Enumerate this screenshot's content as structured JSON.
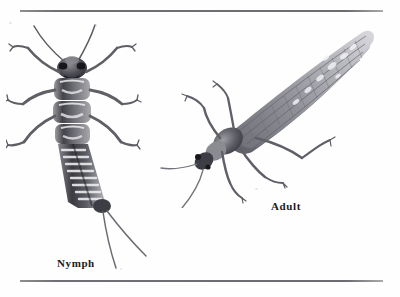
{
  "figure": {
    "type": "scientific-illustration-plate",
    "background_color": "#fefefe",
    "ink_color": "#3b3b3e",
    "rule_color": "#6d6d71",
    "label_color": "#1a1a1a",
    "rules": [
      {
        "name": "top-rule",
        "y": 10,
        "x1": 20,
        "x2": 383
      },
      {
        "name": "bottom-rule",
        "y": 280,
        "x1": 20,
        "x2": 383
      }
    ],
    "captions": {
      "nymph": "Nymph",
      "adult": "Adult"
    },
    "specimens": [
      {
        "name": "nymph",
        "label": "Nymph",
        "orientation": "dorsal view, head up, tilted slightly",
        "features": [
          "two long antennae",
          "compound eyes",
          "three thoracic segments",
          "six legs",
          "segmented banded abdomen",
          "two cerci tails"
        ],
        "shading": "graphite pencil grayscale"
      },
      {
        "name": "adult",
        "label": "Adult",
        "orientation": "diagonal, head lower-left, wings folded over abdomen pointing upper-right",
        "features": [
          "two long antennae",
          "folded veined wings",
          "six legs",
          "pronotum",
          "compound eyes"
        ],
        "shading": "graphite pencil grayscale"
      }
    ]
  }
}
